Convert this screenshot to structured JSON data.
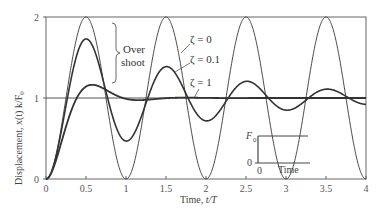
{
  "chart_data": {
    "type": "line",
    "title": "",
    "xlabel": "Time, t/T",
    "ylabel": "Displacement, x(t) k/F0",
    "xlim": [
      0,
      4
    ],
    "ylim": [
      0,
      2
    ],
    "x_ticks": [
      "0",
      "0.5",
      "1",
      "1.5",
      "2",
      "2.5",
      "3",
      "3.5",
      "4"
    ],
    "y_ticks": [
      "0",
      "1",
      "2"
    ],
    "grid": false,
    "reference_line": {
      "y": 1
    },
    "series": [
      {
        "name": "ζ=0",
        "description": "undamped step response x = 1 - cos(2πt/T)",
        "peak": 2.0,
        "peak_times": [
          0.5,
          1.5,
          2.5,
          3.5
        ],
        "min": 0.0,
        "min_times": [
          1,
          2,
          3,
          4
        ]
      },
      {
        "name": "ζ=0.1",
        "description": "underdamped step response",
        "first_peak": 1.73,
        "first_peak_time": 0.5,
        "second_peak": 1.53,
        "final_value": 1.0
      },
      {
        "name": "ζ=1",
        "description": "critically damped-like response with slight overshoot",
        "peak": 1.16,
        "peak_time": 0.6,
        "final_value": 1.0
      }
    ],
    "annotations": [
      {
        "text": "Over shoot",
        "type": "brace"
      },
      {
        "text": "ζ=0"
      },
      {
        "text": "ζ=0.1"
      },
      {
        "text": "ζ=1"
      }
    ],
    "inset": {
      "description": "step force input",
      "y_labels": [
        "F0",
        "0"
      ],
      "x_labels": [
        "0"
      ],
      "xlabel": "Time"
    }
  },
  "labels": {
    "xlabel_prefix": "Time, ",
    "xlabel_var": "t/T",
    "ylabel": "Displacement, x(t) k/F",
    "ylabel_sub": "0",
    "zeta0": "ζ = 0",
    "zeta01": "ζ = 0.1",
    "zeta1": "ζ = 1",
    "over": "Over",
    "shoot": "shoot",
    "inset_F": "F",
    "inset_F_sub": "0",
    "inset_zero_y": "0",
    "inset_zero_x": "0",
    "inset_time": "Time"
  }
}
